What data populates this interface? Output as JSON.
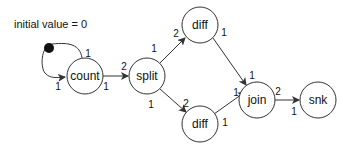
{
  "diagram": {
    "annotation": "initial value = 0",
    "nodes": [
      {
        "id": "count",
        "label": "count"
      },
      {
        "id": "split",
        "label": "split"
      },
      {
        "id": "diff_top",
        "label": "diff"
      },
      {
        "id": "diff_bottom",
        "label": "diff"
      },
      {
        "id": "join",
        "label": "join"
      },
      {
        "id": "snk",
        "label": "snk"
      }
    ],
    "edges": [
      {
        "from": "count",
        "to": "count",
        "kind": "self-loop with initial token",
        "src_rate": "1",
        "dst_rate": "1"
      },
      {
        "from": "count",
        "to": "split",
        "src_rate": "1",
        "dst_rate": "2"
      },
      {
        "from": "split",
        "to": "diff_top",
        "src_rate": "1",
        "dst_rate": "2"
      },
      {
        "from": "split",
        "to": "diff_bottom",
        "src_rate": "1",
        "dst_rate": "2"
      },
      {
        "from": "diff_top",
        "to": "join",
        "src_rate": "1",
        "dst_rate": "1"
      },
      {
        "from": "diff_bottom",
        "to": "join",
        "src_rate": "1",
        "dst_rate": "1"
      },
      {
        "from": "join",
        "to": "snk",
        "src_rate": "2",
        "dst_rate": "1"
      }
    ]
  }
}
